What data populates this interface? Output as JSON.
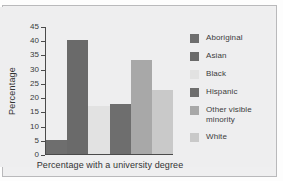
{
  "chart_data": {
    "type": "bar",
    "title": "",
    "subtitle": "",
    "xlabel": "Percentage with a university degree",
    "ylabel": "Percentage",
    "categories": [
      "Aboriginal",
      "Asian",
      "Black",
      "Hispanic",
      "Other visible minority",
      "White"
    ],
    "values": [
      5,
      40,
      17,
      17.5,
      33,
      22.5
    ],
    "colors": [
      "#6e6e6e",
      "#6a6a6a",
      "#e2e2e2",
      "#6e6e6e",
      "#a8a8a8",
      "#c9c9c9"
    ],
    "ylim": [
      0,
      45
    ],
    "ytick_labels": [
      "45",
      "40",
      "35",
      "30",
      "25",
      "20",
      "15",
      "10",
      "5",
      "0"
    ],
    "ytick_values": [
      45,
      40,
      35,
      30,
      25,
      20,
      15,
      10,
      5,
      0
    ],
    "grid": false,
    "legend_position": "right",
    "legend": [
      {
        "label": "Aboriginal",
        "color": "#6e6e6e"
      },
      {
        "label": "Asian",
        "color": "#6a6a6a"
      },
      {
        "label": "Black",
        "color": "#e2e2e2"
      },
      {
        "label": "Hispanic",
        "color": "#6e6e6e"
      },
      {
        "label": "Other visible minority",
        "color": "#a8a8a8"
      },
      {
        "label": "White",
        "color": "#c9c9c9"
      }
    ]
  }
}
